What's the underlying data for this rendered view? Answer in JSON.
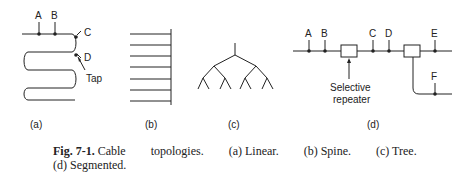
{
  "figure": {
    "panels": [
      {
        "id": "a",
        "label": "(a)",
        "name": "Linear",
        "points": [
          "A",
          "B",
          "C",
          "D"
        ],
        "annotations": [
          "Tap"
        ]
      },
      {
        "id": "b",
        "label": "(b)",
        "name": "Spine"
      },
      {
        "id": "c",
        "label": "(c)",
        "name": "Tree"
      },
      {
        "id": "d",
        "label": "(d)",
        "name": "Segmented",
        "points": [
          "A",
          "B",
          "C",
          "D",
          "E",
          "F"
        ],
        "annotations": [
          "Selective",
          "repeater"
        ]
      }
    ]
  },
  "caption": {
    "lead": "Fig. 7-1.",
    "word1": "Cable",
    "word2": "topologies.",
    "part_a": "(a) Linear.",
    "part_b": "(b) Spine.",
    "part_c": "(c) Tree.",
    "part_d": "(d) Segmented."
  }
}
